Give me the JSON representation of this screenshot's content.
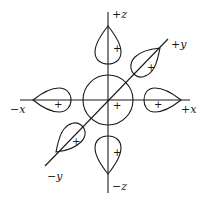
{
  "diagram": {
    "axes": {
      "plus_z": "+z",
      "minus_z": "−z",
      "plus_x": "+x",
      "minus_x": "−x",
      "plus_y": "+y",
      "minus_y": "−y"
    },
    "signs": {
      "center": "+",
      "lobe_plus_z": "+",
      "lobe_minus_z": "+",
      "lobe_plus_x": "+",
      "lobe_minus_x": "+",
      "lobe_plus_y": "+",
      "lobe_minus_y": "+"
    }
  }
}
